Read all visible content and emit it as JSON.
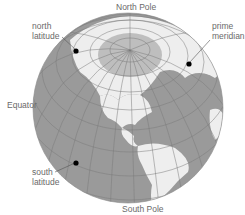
{
  "diagram": {
    "type": "globe-latitude-longitude",
    "colors": {
      "ocean": "#9a9a9a",
      "land": "#eeeeee",
      "grid": "#7a7a7a",
      "label": "#6a6a6a",
      "marker": "#000000"
    },
    "labels": {
      "north_pole": "North Pole",
      "south_pole": "South Pole",
      "equator": "Equator",
      "north_latitude_line1": "north",
      "north_latitude_line2": "latitude",
      "south_latitude_line1": "south",
      "south_latitude_line2": "latitude",
      "prime_meridian_line1": "prime",
      "prime_meridian_line2": "meridian"
    }
  }
}
